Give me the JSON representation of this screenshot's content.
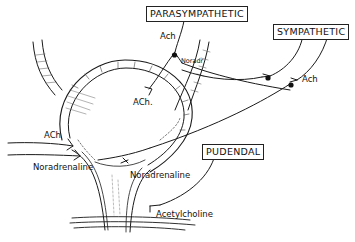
{
  "diagram": {
    "nerve_boxes": {
      "parasympathetic": "PARASYMPATHETIC",
      "sympathetic": "SYMPATHETIC",
      "pudendal": "PUDENDAL"
    },
    "labels": {
      "ach_para_top": "Ach",
      "noradr_short": "Noradr",
      "ach_inner": "ACh.",
      "ach_sympathetic": "Ach",
      "ach_left": "ACh",
      "noradrenaline_left": "Noradrenaline",
      "noradrenaline_center": "Noradrenaline",
      "acetylcholine": "Acetylcholine"
    },
    "colors": {
      "line": "#1a1a1a",
      "background": "#ffffff"
    }
  }
}
